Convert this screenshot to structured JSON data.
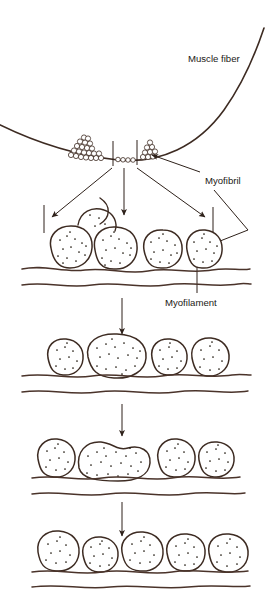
{
  "figure": {
    "background_color": "#ffffff",
    "ink_color": "#3d2b22",
    "line_color": "#4a332a",
    "width": 272,
    "height": 592
  },
  "labels": {
    "muscle_fiber": "Muscle fiber",
    "myofibril": "Myofibril",
    "myofilament": "Myofilament"
  },
  "levels": [
    {
      "name": "muscle-fiber-surface",
      "description": "Curved muscle fiber boundary with granular myofibril clusters",
      "cluster_counts": [
        21,
        8
      ],
      "segment_granules": 5
    },
    {
      "name": "magnification-level-1",
      "description": "Four stippled myofibril bodies resting on wavy membrane",
      "blob_count": 4
    },
    {
      "name": "magnification-level-2",
      "description": "Four stippled myofilament bodies, one elongated",
      "blob_count": 4
    },
    {
      "name": "magnification-level-3",
      "description": "Five stippled bodies with one large fused lobe",
      "blob_count": 5
    },
    {
      "name": "magnification-level-4",
      "description": "Five rounded stippled bodies on wavy membrane",
      "blob_count": 5
    }
  ],
  "arrows": [
    {
      "name": "fanout-left",
      "direction": "down-left"
    },
    {
      "name": "fanout-center",
      "direction": "down"
    },
    {
      "name": "fanout-right",
      "direction": "down-right"
    },
    {
      "name": "myofibril-pointer",
      "direction": "left"
    },
    {
      "name": "myofilament-pointer",
      "direction": "up"
    },
    {
      "name": "step-1-to-2",
      "direction": "down"
    },
    {
      "name": "step-2-to-3",
      "direction": "down"
    },
    {
      "name": "step-3-to-4",
      "direction": "down"
    }
  ]
}
